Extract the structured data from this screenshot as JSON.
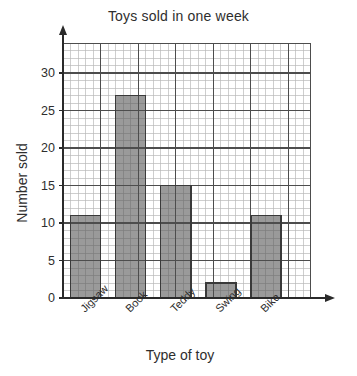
{
  "chart_data": {
    "type": "bar",
    "title": "Toys sold in one week",
    "xlabel": "Type of toy",
    "ylabel": "Number sold",
    "categories": [
      "Jigsaw",
      "Book",
      "Teddy",
      "Swing",
      "Bike"
    ],
    "values": [
      11,
      27,
      15,
      2,
      11
    ],
    "ytick_labels": [
      "0",
      "5",
      "10",
      "15",
      "20",
      "25",
      "30"
    ],
    "ytick_values": [
      0,
      5,
      10,
      15,
      20,
      25,
      30
    ],
    "ylim": [
      0,
      34
    ],
    "ystep_major": 5,
    "ystep_minor": 1,
    "grid": "graph-paper",
    "legend": "none",
    "bar_fill_color": "#9a9a9a",
    "bar_edge_color": "#3a3a3a",
    "grid_minor_color": "#b9b9b9",
    "grid_major_color": "#4d4d4d",
    "axis_color": "#2a2a2a",
    "background_color": "#ffffff"
  }
}
